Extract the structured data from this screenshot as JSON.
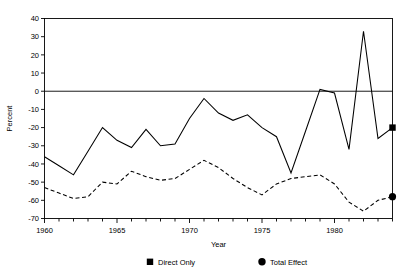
{
  "chart_data": {
    "type": "line",
    "title": "",
    "xlabel": "Year",
    "ylabel": "Percent",
    "xlim": [
      1960,
      1984
    ],
    "ylim": [
      -70,
      40
    ],
    "xticks": [
      1960,
      1965,
      1970,
      1975,
      1980
    ],
    "xtick_labels": [
      "1960",
      "1965",
      "1970",
      "1975",
      "1980"
    ],
    "x_minor_tick_step": 1,
    "yticks": [
      -70,
      -60,
      -50,
      -40,
      -30,
      -20,
      -10,
      0,
      10,
      20,
      30,
      40
    ],
    "ytick_labels": [
      "-70",
      "-60",
      "-50",
      "-40",
      "-30",
      "-20",
      "-10",
      "0",
      "10",
      "20",
      "30",
      "40"
    ],
    "grid": false,
    "zero_line": true,
    "legend_position": "below",
    "x": [
      1960,
      1961,
      1962,
      1963,
      1964,
      1965,
      1966,
      1967,
      1968,
      1969,
      1970,
      1971,
      1972,
      1973,
      1974,
      1975,
      1976,
      1977,
      1978,
      1979,
      1980,
      1981,
      1982,
      1983,
      1984
    ],
    "series": [
      {
        "name": "Direct Only",
        "style": "solid",
        "marker": "square",
        "color": "#000000",
        "values": [
          -36,
          -41,
          -46,
          -33,
          -20,
          -27,
          -31,
          -21,
          -30,
          -29,
          -15,
          -4,
          -12,
          -16,
          -13,
          -20,
          -25,
          -45,
          -22,
          1,
          -1,
          -32,
          33,
          -26,
          -20
        ]
      },
      {
        "name": "Total Effect",
        "style": "dashed",
        "marker": "circle",
        "color": "#000000",
        "values": [
          -53,
          -56,
          -59,
          -58,
          -50,
          -51,
          -44,
          -47,
          -49,
          -48,
          -43,
          -38,
          -42,
          -48,
          -53,
          -57,
          -51,
          -48,
          -47,
          -46,
          -51,
          -61,
          -66,
          -60,
          -58
        ]
      }
    ],
    "end_markers": [
      {
        "name": "Direct Only",
        "marker": "square",
        "x": 1984,
        "y": -20
      },
      {
        "name": "Total Effect",
        "marker": "circle",
        "x": 1984,
        "y": -58
      }
    ]
  },
  "legend": {
    "items": [
      {
        "label": "Direct Only",
        "marker": "square"
      },
      {
        "label": "Total Effect",
        "marker": "circle"
      }
    ]
  }
}
